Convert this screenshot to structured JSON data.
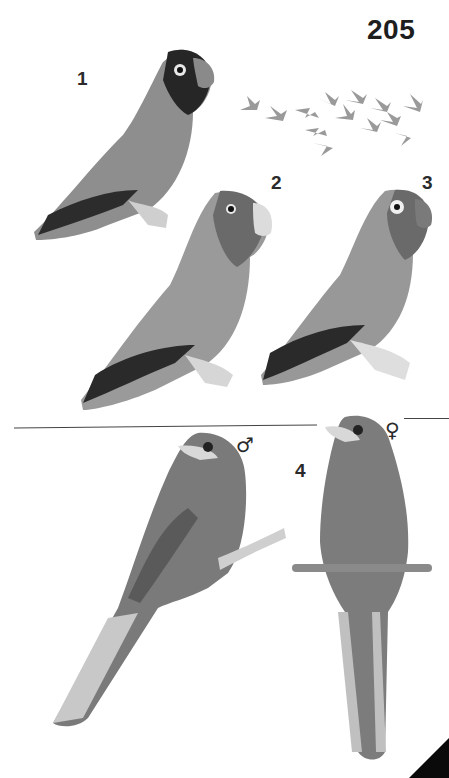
{
  "page": {
    "number": "205"
  },
  "plate": {
    "figures": [
      {
        "label": "1",
        "subject": "lovebird, dark-headed, perched"
      },
      {
        "label": "2",
        "subject": "lovebird, reddish face, perched"
      },
      {
        "label": "3",
        "subject": "lovebird, eye-ring, perched"
      },
      {
        "label": "4",
        "subject": "long-tailed bird, male and female"
      }
    ],
    "flock": {
      "subject": "flock of lovebirds in flight",
      "count": 13
    },
    "sex_symbols": {
      "male": "♂",
      "female": "♀"
    }
  },
  "colors": {
    "background": "#ffffff",
    "text": "#222222",
    "divider": "#444444",
    "bird_dark": "#3a3a3a",
    "bird_mid": "#8a8a8a",
    "bird_light": "#c4c4c4"
  }
}
